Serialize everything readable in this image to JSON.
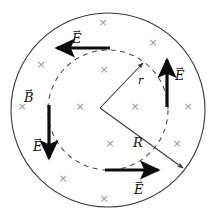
{
  "figure": {
    "colors": {
      "stroke": "#3a3a3a",
      "dashed": "#4a4a4a",
      "arrow": "#0c0c0c",
      "cross": "#9a9a9a",
      "label": "#101010",
      "background": "#ffffff"
    },
    "outer_circle": {
      "cx": 108,
      "cy": 110,
      "r": 97,
      "style": "solid"
    },
    "inner_circle": {
      "cx": 108,
      "cy": 110,
      "r": 60,
      "style": "dashed"
    },
    "radius_lines": [
      {
        "name": "r",
        "from": [
          100,
          108
        ],
        "to": [
          143,
          63
        ],
        "arrowhead": true
      },
      {
        "name": "R",
        "from": [
          100,
          108
        ],
        "to": [
          183,
          168
        ],
        "arrowhead": true
      }
    ],
    "labels": [
      {
        "name": "E-top",
        "text": "E",
        "vector": true,
        "x": 72,
        "y": 32
      },
      {
        "name": "E-right",
        "text": "E",
        "vector": true,
        "x": 175,
        "y": 69
      },
      {
        "name": "E-left",
        "text": "E",
        "vector": true,
        "x": 33,
        "y": 140
      },
      {
        "name": "E-bottom",
        "text": "E",
        "vector": true,
        "x": 134,
        "y": 183
      },
      {
        "name": "B-field",
        "text": "B",
        "vector": true,
        "x": 24,
        "y": 91
      },
      {
        "name": "r-radius",
        "text": "r",
        "vector": false,
        "x": 138,
        "y": 75
      },
      {
        "name": "R-radius",
        "text": "R",
        "vector": false,
        "x": 133,
        "y": 136
      }
    ],
    "field_arrows": [
      {
        "name": "E-arrow-top",
        "direction": "left",
        "from": [
          110,
          48
        ],
        "to": [
          55,
          48
        ]
      },
      {
        "name": "E-arrow-right",
        "direction": "up",
        "from": [
          167,
          107
        ],
        "to": [
          167,
          58
        ]
      },
      {
        "name": "E-arrow-left",
        "direction": "down",
        "from": [
          49,
          105
        ],
        "to": [
          49,
          160
        ]
      },
      {
        "name": "E-arrow-bottom",
        "direction": "right",
        "from": [
          105,
          170
        ],
        "to": [
          160,
          170
        ]
      }
    ],
    "crosses": [
      {
        "x": 103,
        "y": 22
      },
      {
        "x": 153,
        "y": 42
      },
      {
        "x": 41,
        "y": 64
      },
      {
        "x": 104,
        "y": 69
      },
      {
        "x": 22,
        "y": 106
      },
      {
        "x": 80,
        "y": 106
      },
      {
        "x": 135,
        "y": 106
      },
      {
        "x": 188,
        "y": 106
      },
      {
        "x": 110,
        "y": 143
      },
      {
        "x": 177,
        "y": 143
      },
      {
        "x": 63,
        "y": 178
      },
      {
        "x": 104,
        "y": 198
      }
    ],
    "cross_symbol": "×"
  }
}
